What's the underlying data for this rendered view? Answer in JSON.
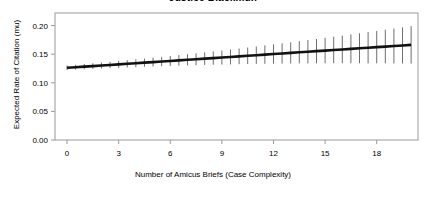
{
  "chart_data": {
    "type": "line",
    "title": "Justice Blackmun",
    "xlabel": "Number of Amicus Briefs (Case Complexity)",
    "ylabel": "Expected Rate of Citation (mu)",
    "xlim": [
      -0.7,
      20.4
    ],
    "ylim": [
      0.0,
      0.222
    ],
    "xticks": [
      0,
      3,
      6,
      9,
      12,
      15,
      18
    ],
    "xtick_labels": [
      "0",
      "3",
      "6",
      "9",
      "12",
      "15",
      "18"
    ],
    "yticks": [
      0.0,
      0.05,
      0.1,
      0.15,
      0.2
    ],
    "ytick_labels": [
      "0.00",
      "0.05",
      "0.10",
      "0.15",
      "0.20"
    ],
    "grid": false,
    "legend": null,
    "line_color": "#111111",
    "errorbar_color": "#6e6e6e",
    "series": [
      {
        "name": "Expected rate of citation",
        "x": [
          0,
          0.5,
          1,
          1.5,
          2,
          2.5,
          3,
          3.5,
          4,
          4.5,
          5,
          5.5,
          6,
          6.5,
          7,
          7.5,
          8,
          8.5,
          9,
          9.5,
          10,
          10.5,
          11,
          11.5,
          12,
          12.5,
          13,
          13.5,
          14,
          14.5,
          15,
          15.5,
          16,
          16.5,
          17,
          17.5,
          18,
          18.5,
          19,
          19.5,
          20
        ],
        "values": [
          0.1262,
          0.1272,
          0.1282,
          0.1292,
          0.1302,
          0.1312,
          0.1322,
          0.1332,
          0.1342,
          0.1352,
          0.1362,
          0.1372,
          0.1382,
          0.1392,
          0.1402,
          0.1412,
          0.1422,
          0.1432,
          0.1442,
          0.1452,
          0.1462,
          0.1472,
          0.1482,
          0.1493,
          0.1503,
          0.1513,
          0.1523,
          0.1533,
          0.1543,
          0.1553,
          0.1563,
          0.1573,
          0.1583,
          0.1593,
          0.1603,
          0.1613,
          0.1623,
          0.1633,
          0.1643,
          0.1653,
          0.1663
        ],
        "ci_lower": [
          0.1222,
          0.1229,
          0.1236,
          0.1243,
          0.125,
          0.1256,
          0.1262,
          0.1268,
          0.1274,
          0.128,
          0.1285,
          0.129,
          0.1295,
          0.13,
          0.1304,
          0.1308,
          0.1312,
          0.1316,
          0.1319,
          0.1322,
          0.1325,
          0.1328,
          0.133,
          0.1332,
          0.1334,
          0.1336,
          0.1337,
          0.1338,
          0.1339,
          0.134,
          0.134,
          0.1341,
          0.1341,
          0.1341,
          0.1341,
          0.134,
          0.134,
          0.1339,
          0.1338,
          0.1337,
          0.1336
        ],
        "ci_upper": [
          0.1302,
          0.1315,
          0.1328,
          0.1341,
          0.1354,
          0.1368,
          0.1382,
          0.1396,
          0.141,
          0.1424,
          0.1439,
          0.1454,
          0.1469,
          0.1484,
          0.15,
          0.1516,
          0.1532,
          0.1548,
          0.1565,
          0.1582,
          0.1599,
          0.1616,
          0.1634,
          0.1654,
          0.1672,
          0.169,
          0.1709,
          0.1728,
          0.1747,
          0.1766,
          0.1786,
          0.1805,
          0.1825,
          0.1845,
          0.1865,
          0.1886,
          0.1906,
          0.1927,
          0.1948,
          0.1969,
          0.199
        ]
      }
    ]
  }
}
